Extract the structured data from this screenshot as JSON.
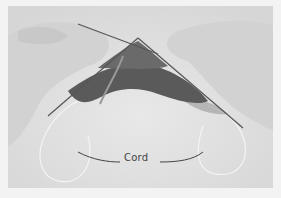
{
  "image": {
    "description": "Black and white photograph of two hands knitting in the round on circular needles, with the flexible cord labeled",
    "annotation_label": "Cord",
    "colors": {
      "background": "#e2e2e2",
      "frame": "#f3f3f3",
      "knitting": "#5a5a5a",
      "hands": "#d8d8d8",
      "annotation_line": "#444444"
    }
  }
}
